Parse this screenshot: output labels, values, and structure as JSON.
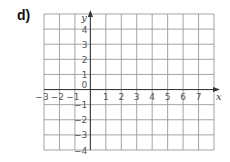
{
  "question_label": "d)",
  "chart_data": {
    "type": "grid",
    "title": "",
    "xlabel": "x",
    "ylabel": "y",
    "xlim": [
      -3,
      8
    ],
    "ylim": [
      -4,
      5
    ],
    "grid": true,
    "x_ticks": [
      "−3",
      "−2",
      "−1",
      "1",
      "2",
      "3",
      "4",
      "5",
      "6",
      "7"
    ],
    "y_ticks": [
      "4",
      "3",
      "2",
      "1",
      "−1",
      "−2",
      "−3",
      "−4"
    ],
    "origin_label": "0",
    "points": []
  },
  "colors": {
    "grid": "#9a9a9a",
    "axis": "#333333",
    "text": "#555555"
  }
}
